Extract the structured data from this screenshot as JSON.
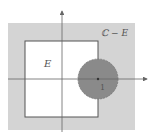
{
  "diagram": {
    "labels": {
      "set_E": "E",
      "complement": "ℂ − E",
      "unit_point": "1"
    },
    "colors": {
      "background": "#ffffff",
      "complement_fill": "#d4d4d4",
      "set_fill": "#ffffff",
      "disc_fill": "#8a8a8a",
      "stroke": "#555555",
      "axis": "#666666"
    }
  }
}
